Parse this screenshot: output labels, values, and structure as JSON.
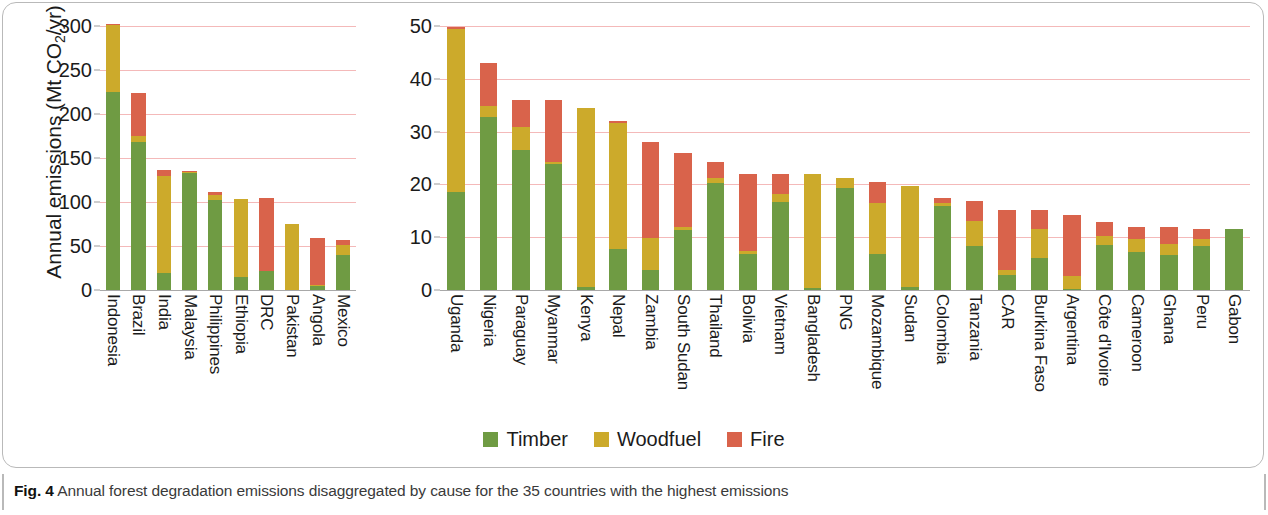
{
  "figure": {
    "caption_number": "Fig. 4",
    "caption_text": "Annual forest degradation emissions disaggregated by cause for the 35 countries with the highest emissions"
  },
  "legend": {
    "position": "bottom-center",
    "items": [
      {
        "label": "Timber",
        "color": "#6f9b43"
      },
      {
        "label": "Woodfuel",
        "color": "#ccaa2b"
      },
      {
        "label": "Fire",
        "color": "#d9634b"
      }
    ]
  },
  "axis": {
    "ylabel_prefix": "Annual emissions (Mt CO",
    "ylabel_sub": "2",
    "ylabel_suffix": "/yr)"
  },
  "chart_data": [
    {
      "id": "panel-left",
      "type": "bar",
      "stacked": true,
      "title": "",
      "xlabel": "",
      "ylabel": "Annual emissions (Mt CO2/yr)",
      "ylim": [
        0,
        300
      ],
      "yticks": [
        0,
        50,
        100,
        150,
        200,
        250,
        300
      ],
      "grid": true,
      "categories": [
        "Indonesia",
        "Brazil",
        "India",
        "Malaysia",
        "Philippines",
        "Ethiopia",
        "DRC",
        "Pakistan",
        "Angola",
        "Mexico"
      ],
      "series": [
        {
          "name": "Timber",
          "color": "#6f9b43",
          "values": [
            225,
            168,
            19,
            133,
            102,
            15,
            22,
            0,
            5,
            40
          ]
        },
        {
          "name": "Woodfuel",
          "color": "#ccaa2b",
          "values": [
            76,
            7,
            111,
            1,
            6,
            89,
            0,
            75,
            1,
            11
          ]
        },
        {
          "name": "Fire",
          "color": "#d9634b",
          "values": [
            1,
            49,
            6,
            1,
            3,
            0,
            83,
            0,
            53,
            6
          ]
        }
      ],
      "totals": [
        302,
        224,
        136,
        135,
        111,
        104,
        105,
        75,
        59,
        57
      ]
    },
    {
      "id": "panel-right",
      "type": "bar",
      "stacked": true,
      "title": "",
      "xlabel": "",
      "ylabel": "Annual emissions (Mt CO2/yr)",
      "ylim": [
        0,
        50
      ],
      "yticks": [
        0,
        10,
        20,
        30,
        40,
        50
      ],
      "grid": true,
      "categories": [
        "Uganda",
        "Nigeria",
        "Paraguay",
        "Myanmar",
        "Kenya",
        "Nepal",
        "Zambia",
        "South Sudan",
        "Thailand",
        "Bolivia",
        "Vietnam",
        "Bangladesh",
        "PNG",
        "Mozambique",
        "Sudan",
        "Colombia",
        "Tanzania",
        "CAR",
        "Burkina Faso",
        "Argentina",
        "Côte d'Ivoire",
        "Cameroon",
        "Ghana",
        "Peru",
        "Gabon"
      ],
      "series": [
        {
          "name": "Timber",
          "color": "#6f9b43",
          "values": [
            18.5,
            32.8,
            26.6,
            23.8,
            0.6,
            7.8,
            3.8,
            11.3,
            20.3,
            6.8,
            16.7,
            0.4,
            19.3,
            6.8,
            0.5,
            16.0,
            8.3,
            2.8,
            6.0,
            0.2,
            8.5,
            7.2,
            6.7,
            8.4,
            11.5
          ]
        },
        {
          "name": "Woodfuel",
          "color": "#ccaa2b",
          "values": [
            30.9,
            2.0,
            4.3,
            0.4,
            33.9,
            23.9,
            6.0,
            0.6,
            1.0,
            0.6,
            1.4,
            21.6,
            1.9,
            9.6,
            19.2,
            0.5,
            4.7,
            1.0,
            5.6,
            2.5,
            1.8,
            2.4,
            2.0,
            1.3,
            0.0
          ]
        },
        {
          "name": "Fire",
          "color": "#d9634b",
          "values": [
            0.5,
            8.2,
            5.1,
            11.7,
            0.0,
            0.3,
            18.2,
            14.1,
            2.9,
            14.6,
            3.8,
            0.0,
            0.0,
            4.0,
            0.0,
            0.9,
            3.8,
            11.3,
            3.5,
            11.5,
            2.5,
            2.4,
            3.2,
            1.9,
            0.0
          ]
        }
      ],
      "totals": [
        49.9,
        43.0,
        36.0,
        35.9,
        34.5,
        32.0,
        28.0,
        26.0,
        24.2,
        22.0,
        21.9,
        22.0,
        21.2,
        20.4,
        19.7,
        17.4,
        16.8,
        15.1,
        15.1,
        14.2,
        12.8,
        12.0,
        11.9,
        11.6,
        11.5
      ]
    }
  ]
}
